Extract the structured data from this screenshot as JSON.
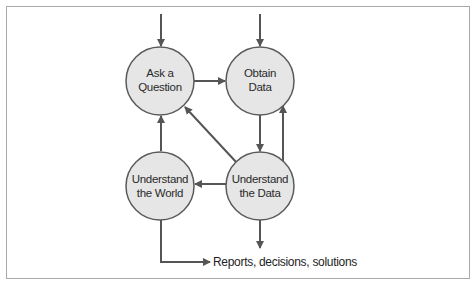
{
  "diagram": {
    "type": "flowchart",
    "colors": {
      "node_fill": "#e6e6e6",
      "node_stroke": "#5a5a5a",
      "edge": "#555555",
      "text": "#2a2a2a",
      "frame_border": "#a9a9a9"
    },
    "nodes": [
      {
        "id": "ask",
        "lines": [
          "Ask a",
          "Question"
        ]
      },
      {
        "id": "obtain",
        "lines": [
          "Obtain",
          "Data"
        ]
      },
      {
        "id": "world",
        "lines": [
          "Understand",
          "the World"
        ]
      },
      {
        "id": "data",
        "lines": [
          "Understand",
          "the Data"
        ]
      }
    ],
    "edges": [
      {
        "from": "entry",
        "to": "ask"
      },
      {
        "from": "entry",
        "to": "obtain"
      },
      {
        "from": "ask",
        "to": "obtain"
      },
      {
        "from": "obtain",
        "to": "data"
      },
      {
        "from": "data",
        "to": "obtain"
      },
      {
        "from": "data",
        "to": "ask"
      },
      {
        "from": "data",
        "to": "world"
      },
      {
        "from": "world",
        "to": "ask"
      },
      {
        "from": "data",
        "to": "exit"
      },
      {
        "from": "world",
        "to": "output"
      }
    ],
    "output_label": "Reports, decisions, solutions"
  }
}
